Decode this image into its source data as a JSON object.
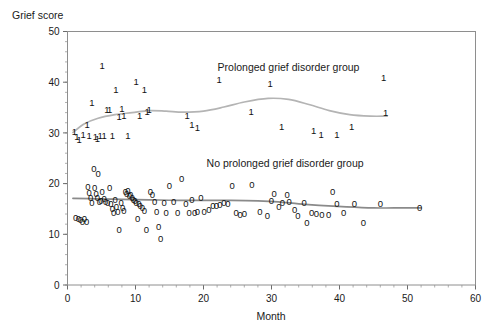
{
  "chart_data": {
    "type": "scatter",
    "title": "",
    "xlabel": "Month",
    "ylabel": "Grief score",
    "xlim": [
      0,
      60
    ],
    "ylim": [
      0,
      50
    ],
    "xticks": [
      0,
      10,
      20,
      30,
      40,
      50,
      60
    ],
    "yticks": [
      0,
      10,
      20,
      30,
      40,
      50
    ],
    "xtick_step_minor": 2,
    "ytick_step_minor": 2,
    "grid": false,
    "legend_position": "in-plot annotations",
    "marker_style": "digit glyph labels (1 = prolonged group, 0 = no prolonged group)",
    "annotations": [
      {
        "text": "Prolonged grief disorder group",
        "x": 32.5,
        "y": 42.3
      },
      {
        "text": "No prolonged grief disorder group",
        "x": 32.0,
        "y": 23.2
      }
    ],
    "series": [
      {
        "name": "Prolonged grief disorder group",
        "marker": "1",
        "trend_color": "#b4b4b4",
        "points": [
          {
            "x": 1.0,
            "y": 30.2
          },
          {
            "x": 1.4,
            "y": 29.3
          },
          {
            "x": 1.7,
            "y": 28.6
          },
          {
            "x": 2.3,
            "y": 29.6
          },
          {
            "x": 2.9,
            "y": 31.6
          },
          {
            "x": 3.2,
            "y": 29.4
          },
          {
            "x": 3.6,
            "y": 36.0
          },
          {
            "x": 4.1,
            "y": 29.3
          },
          {
            "x": 4.4,
            "y": 28.8
          },
          {
            "x": 4.8,
            "y": 29.5
          },
          {
            "x": 5.1,
            "y": 43.3
          },
          {
            "x": 5.4,
            "y": 29.4
          },
          {
            "x": 5.8,
            "y": 34.5
          },
          {
            "x": 6.2,
            "y": 34.6
          },
          {
            "x": 6.6,
            "y": 29.4
          },
          {
            "x": 7.1,
            "y": 38.5
          },
          {
            "x": 7.6,
            "y": 33.2
          },
          {
            "x": 8.0,
            "y": 34.8
          },
          {
            "x": 8.3,
            "y": 33.4
          },
          {
            "x": 8.9,
            "y": 29.4
          },
          {
            "x": 10.1,
            "y": 40.1
          },
          {
            "x": 10.6,
            "y": 33.4
          },
          {
            "x": 11.3,
            "y": 38.6
          },
          {
            "x": 11.7,
            "y": 34.2
          },
          {
            "x": 12.0,
            "y": 34.6
          },
          {
            "x": 17.6,
            "y": 33.4
          },
          {
            "x": 18.3,
            "y": 31.6
          },
          {
            "x": 19.1,
            "y": 31.0
          },
          {
            "x": 22.3,
            "y": 40.6
          },
          {
            "x": 27.0,
            "y": 34.2
          },
          {
            "x": 29.8,
            "y": 39.8
          },
          {
            "x": 31.5,
            "y": 31.3
          },
          {
            "x": 36.2,
            "y": 30.4
          },
          {
            "x": 37.3,
            "y": 29.6
          },
          {
            "x": 39.6,
            "y": 29.6
          },
          {
            "x": 41.8,
            "y": 31.3
          },
          {
            "x": 46.8,
            "y": 34.0
          },
          {
            "x": 46.5,
            "y": 41.0
          }
        ],
        "trend": [
          {
            "x": 0.8,
            "y": 30.1
          },
          {
            "x": 2.5,
            "y": 31.8
          },
          {
            "x": 4.5,
            "y": 32.9
          },
          {
            "x": 7.0,
            "y": 33.6
          },
          {
            "x": 9.5,
            "y": 34.0
          },
          {
            "x": 12.0,
            "y": 34.4
          },
          {
            "x": 14.5,
            "y": 34.3
          },
          {
            "x": 17.0,
            "y": 34.1
          },
          {
            "x": 20.0,
            "y": 34.3
          },
          {
            "x": 23.0,
            "y": 35.1
          },
          {
            "x": 26.0,
            "y": 36.1
          },
          {
            "x": 29.5,
            "y": 36.8
          },
          {
            "x": 32.5,
            "y": 36.6
          },
          {
            "x": 35.5,
            "y": 35.6
          },
          {
            "x": 38.5,
            "y": 34.4
          },
          {
            "x": 41.5,
            "y": 33.6
          },
          {
            "x": 44.5,
            "y": 33.3
          },
          {
            "x": 47.0,
            "y": 33.3
          }
        ]
      },
      {
        "name": "No prolonged grief disorder group",
        "marker": "0",
        "trend_color": "#8a8a8a",
        "points": [
          {
            "x": 1.2,
            "y": 13.2
          },
          {
            "x": 1.6,
            "y": 13.0
          },
          {
            "x": 1.9,
            "y": 12.9
          },
          {
            "x": 2.2,
            "y": 12.6
          },
          {
            "x": 2.5,
            "y": 13.0
          },
          {
            "x": 2.8,
            "y": 12.5
          },
          {
            "x": 3.0,
            "y": 19.5
          },
          {
            "x": 3.2,
            "y": 18.2
          },
          {
            "x": 3.4,
            "y": 17.3
          },
          {
            "x": 3.6,
            "y": 16.3
          },
          {
            "x": 3.9,
            "y": 22.9
          },
          {
            "x": 4.0,
            "y": 19.3
          },
          {
            "x": 4.2,
            "y": 18.0
          },
          {
            "x": 4.4,
            "y": 17.2
          },
          {
            "x": 4.5,
            "y": 22.0
          },
          {
            "x": 4.7,
            "y": 16.4
          },
          {
            "x": 4.9,
            "y": 16.6
          },
          {
            "x": 5.1,
            "y": 18.5
          },
          {
            "x": 5.4,
            "y": 17.1
          },
          {
            "x": 5.6,
            "y": 16.5
          },
          {
            "x": 5.9,
            "y": 16.2
          },
          {
            "x": 6.2,
            "y": 19.3
          },
          {
            "x": 6.4,
            "y": 16.0
          },
          {
            "x": 6.6,
            "y": 15.0
          },
          {
            "x": 6.8,
            "y": 14.3
          },
          {
            "x": 7.0,
            "y": 16.8
          },
          {
            "x": 7.2,
            "y": 15.4
          },
          {
            "x": 7.4,
            "y": 14.5
          },
          {
            "x": 7.6,
            "y": 11.0
          },
          {
            "x": 7.9,
            "y": 16.3
          },
          {
            "x": 8.1,
            "y": 15.2
          },
          {
            "x": 8.3,
            "y": 14.6
          },
          {
            "x": 8.5,
            "y": 18.4
          },
          {
            "x": 8.7,
            "y": 18.0
          },
          {
            "x": 8.9,
            "y": 18.6
          },
          {
            "x": 9.1,
            "y": 17.6
          },
          {
            "x": 9.3,
            "y": 17.8
          },
          {
            "x": 9.5,
            "y": 17.2
          },
          {
            "x": 9.7,
            "y": 16.9
          },
          {
            "x": 9.9,
            "y": 16.6
          },
          {
            "x": 10.1,
            "y": 16.3
          },
          {
            "x": 10.3,
            "y": 13.0
          },
          {
            "x": 10.5,
            "y": 16.0
          },
          {
            "x": 10.7,
            "y": 15.6
          },
          {
            "x": 11.0,
            "y": 15.2
          },
          {
            "x": 11.3,
            "y": 14.6
          },
          {
            "x": 11.6,
            "y": 10.9
          },
          {
            "x": 12.2,
            "y": 18.5
          },
          {
            "x": 12.5,
            "y": 17.8
          },
          {
            "x": 12.8,
            "y": 16.5
          },
          {
            "x": 13.1,
            "y": 14.5
          },
          {
            "x": 13.4,
            "y": 11.5
          },
          {
            "x": 13.7,
            "y": 9.2
          },
          {
            "x": 14.2,
            "y": 16.3
          },
          {
            "x": 14.5,
            "y": 14.3
          },
          {
            "x": 15.0,
            "y": 19.6
          },
          {
            "x": 15.6,
            "y": 16.4
          },
          {
            "x": 16.2,
            "y": 14.3
          },
          {
            "x": 16.8,
            "y": 20.9
          },
          {
            "x": 17.4,
            "y": 16.1
          },
          {
            "x": 17.9,
            "y": 14.3
          },
          {
            "x": 18.3,
            "y": 16.9
          },
          {
            "x": 18.7,
            "y": 14.3
          },
          {
            "x": 19.1,
            "y": 14.4
          },
          {
            "x": 19.6,
            "y": 17.3
          },
          {
            "x": 20.1,
            "y": 14.4
          },
          {
            "x": 20.8,
            "y": 14.8
          },
          {
            "x": 21.4,
            "y": 15.6
          },
          {
            "x": 21.9,
            "y": 15.7
          },
          {
            "x": 22.4,
            "y": 15.8
          },
          {
            "x": 23.0,
            "y": 16.3
          },
          {
            "x": 23.6,
            "y": 16.1
          },
          {
            "x": 24.2,
            "y": 19.6
          },
          {
            "x": 24.8,
            "y": 14.2
          },
          {
            "x": 25.4,
            "y": 13.9
          },
          {
            "x": 26.0,
            "y": 14.0
          },
          {
            "x": 27.1,
            "y": 19.9
          },
          {
            "x": 28.3,
            "y": 14.4
          },
          {
            "x": 29.4,
            "y": 13.6
          },
          {
            "x": 30.0,
            "y": 16.6
          },
          {
            "x": 30.4,
            "y": 18.0
          },
          {
            "x": 31.1,
            "y": 15.5
          },
          {
            "x": 31.6,
            "y": 16.2
          },
          {
            "x": 32.3,
            "y": 17.8
          },
          {
            "x": 32.6,
            "y": 16.5
          },
          {
            "x": 33.4,
            "y": 14.9
          },
          {
            "x": 33.9,
            "y": 13.6
          },
          {
            "x": 34.8,
            "y": 16.3
          },
          {
            "x": 35.2,
            "y": 12.3
          },
          {
            "x": 35.9,
            "y": 14.2
          },
          {
            "x": 36.6,
            "y": 14.0
          },
          {
            "x": 37.4,
            "y": 13.8
          },
          {
            "x": 38.4,
            "y": 13.9
          },
          {
            "x": 39.0,
            "y": 18.5
          },
          {
            "x": 39.6,
            "y": 16.0
          },
          {
            "x": 40.6,
            "y": 14.3
          },
          {
            "x": 42.2,
            "y": 16.0
          },
          {
            "x": 43.5,
            "y": 12.3
          },
          {
            "x": 46.0,
            "y": 16.0
          },
          {
            "x": 51.8,
            "y": 15.2
          }
        ],
        "trend": [
          {
            "x": 0.8,
            "y": 17.1
          },
          {
            "x": 4.0,
            "y": 17.0
          },
          {
            "x": 8.0,
            "y": 16.9
          },
          {
            "x": 12.0,
            "y": 16.8
          },
          {
            "x": 16.0,
            "y": 16.7
          },
          {
            "x": 20.0,
            "y": 16.7
          },
          {
            "x": 24.0,
            "y": 16.7
          },
          {
            "x": 28.0,
            "y": 16.6
          },
          {
            "x": 31.0,
            "y": 16.4
          },
          {
            "x": 34.0,
            "y": 16.0
          },
          {
            "x": 37.0,
            "y": 15.7
          },
          {
            "x": 41.0,
            "y": 15.4
          },
          {
            "x": 45.0,
            "y": 15.2
          },
          {
            "x": 48.0,
            "y": 15.2
          },
          {
            "x": 52.0,
            "y": 15.2
          }
        ]
      }
    ]
  },
  "axes": {
    "ylabel": "Grief score",
    "xlabel": "Month",
    "xtick_labels": [
      "0",
      "10",
      "20",
      "30",
      "40",
      "50",
      "60"
    ],
    "ytick_labels": [
      "0",
      "10",
      "20",
      "30",
      "40",
      "50"
    ]
  },
  "colors": {
    "frame": "#8e8e8e",
    "text": "#1a1a1a",
    "trend_group1": "#b4b4b4",
    "trend_group0": "#8a8a8a",
    "background": "#ffffff"
  }
}
